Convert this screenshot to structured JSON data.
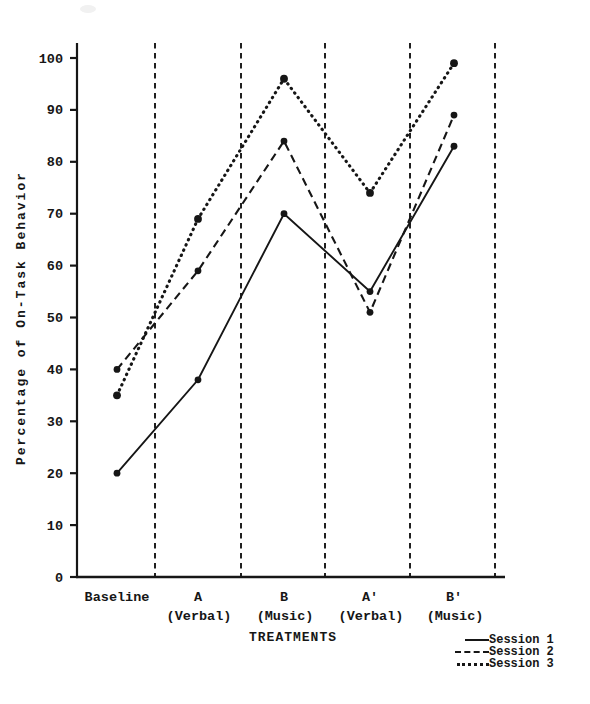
{
  "figure": {
    "background": "#ffffff",
    "ink_color": "#161616"
  },
  "chart_data": {
    "type": "line",
    "title": "",
    "xlabel": "TREATMENTS",
    "ylabel": "Percentage of On-Task Behavior",
    "categories": [
      "Baseline",
      "A",
      "B",
      "A'",
      "B'"
    ],
    "category_sublabels": [
      "",
      "(Verbal)",
      "(Music)",
      "(Verbal)",
      "(Music)"
    ],
    "series": [
      {
        "name": "Session 1",
        "style": "solid",
        "values": [
          20,
          38,
          70,
          55,
          83
        ]
      },
      {
        "name": "Session 2",
        "style": "dashed",
        "values": [
          40,
          59,
          84,
          51,
          89
        ]
      },
      {
        "name": "Session 3",
        "style": "dotted",
        "values": [
          35,
          69,
          96,
          74,
          99
        ]
      }
    ],
    "ylim": [
      0,
      100
    ],
    "yticks": [
      0,
      10,
      20,
      30,
      40,
      50,
      60,
      70,
      80,
      90,
      100
    ],
    "grid": false,
    "separators": {
      "style": "vertical-dashed",
      "between_phases": true,
      "count": 5
    },
    "marker": "filled-circle",
    "legend_position": "bottom-right"
  }
}
